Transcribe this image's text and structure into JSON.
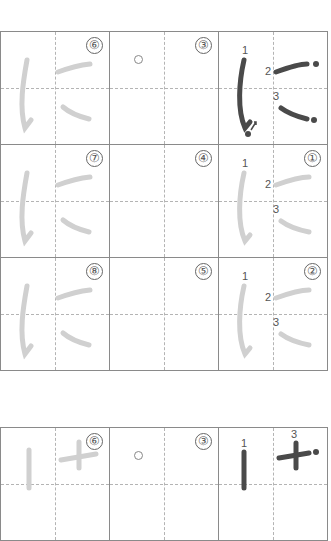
{
  "worksheet": {
    "character": "に",
    "colors": {
      "grid_line": "#8a8a8a",
      "guide_line": "#b4b4b4",
      "trace_stroke": "#d0d0d0",
      "model_stroke": "#4a4a4a"
    },
    "grid1": {
      "rows": [
        [
          {
            "type": "trace",
            "label": "⑥"
          },
          {
            "type": "blank-start",
            "label": "③"
          },
          {
            "type": "model",
            "label": "",
            "stroke_numbers": [
              "1",
              "2",
              "3"
            ]
          }
        ],
        [
          {
            "type": "trace",
            "label": "⑦"
          },
          {
            "type": "blank",
            "label": "④"
          },
          {
            "type": "trace-numbered",
            "label": "①",
            "stroke_numbers": [
              "1",
              "2",
              "3"
            ]
          }
        ],
        [
          {
            "type": "trace",
            "label": "⑧"
          },
          {
            "type": "blank",
            "label": "⑤"
          },
          {
            "type": "trace-numbered",
            "label": "②",
            "stroke_numbers": [
              "1",
              "2",
              "3"
            ]
          }
        ]
      ]
    },
    "grid2": {
      "rows": [
        [
          {
            "type": "trace",
            "label": "⑥"
          },
          {
            "type": "blank-start",
            "label": "③"
          },
          {
            "type": "model",
            "label": "",
            "stroke_numbers": [
              "1",
              "3"
            ]
          }
        ]
      ]
    }
  }
}
